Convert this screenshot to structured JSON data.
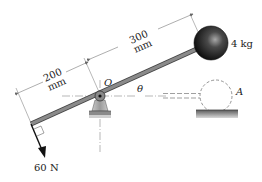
{
  "diagram": {
    "type": "mechanics-lever",
    "labels": {
      "left_length_value": "200",
      "left_length_unit": "mm",
      "right_length_value": "300",
      "right_length_unit": "mm",
      "pivot": "O",
      "angle": "θ",
      "mass": "4 kg",
      "position_marker": "A",
      "force": "60 N"
    },
    "colors": {
      "ink": "#222222",
      "lever": "#6a6a6a",
      "ball_dark": "#111111",
      "ball_light": "#9a9a9a",
      "ground": "#7a7a7a",
      "dimension_line": "#777777"
    }
  }
}
